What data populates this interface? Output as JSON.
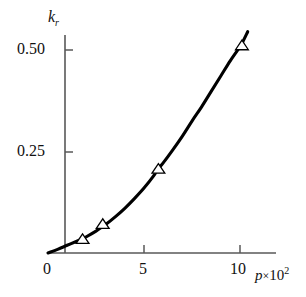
{
  "chart_data": {
    "type": "line",
    "title": "",
    "subtitle": "",
    "xlabel": "p×10²",
    "ylabel": "k_r",
    "xlabel_base": "p",
    "xlabel_exponent": "2",
    "ylabel_base": "k",
    "ylabel_subscript": "r",
    "xlim": [
      0,
      11.2
    ],
    "ylim": [
      0,
      0.57
    ],
    "xticks": [
      0,
      5,
      10
    ],
    "xtick_labels": [
      "0",
      "5",
      "10"
    ],
    "yticks": [
      0.25,
      0.5
    ],
    "ytick_labels": [
      "0.25",
      "0.50"
    ],
    "grid": false,
    "legend": null,
    "marker": "open-triangle-up",
    "line_color": "#000000",
    "marker_edge_color": "#000000",
    "marker_face_color": "#ffffff",
    "axis_color": "#4a4a4a",
    "background": "#ffffff",
    "series": [
      {
        "name": "fitted curve",
        "type": "line",
        "x": [
          0.0,
          0.5,
          1.0,
          1.5,
          1.8,
          2.0,
          2.5,
          2.75,
          3.0,
          3.5,
          4.0,
          4.5,
          5.0,
          5.5,
          5.7,
          6.0,
          6.5,
          7.0,
          7.5,
          8.0,
          8.5,
          9.0,
          9.5,
          10.0,
          10.1,
          10.4
        ],
        "y": [
          0.0,
          0.009,
          0.019,
          0.029,
          0.035,
          0.04,
          0.054,
          0.062,
          0.07,
          0.089,
          0.11,
          0.134,
          0.16,
          0.19,
          0.205,
          0.222,
          0.254,
          0.288,
          0.325,
          0.36,
          0.398,
          0.436,
          0.474,
          0.508,
          0.516,
          0.545
        ]
      },
      {
        "name": "measured data",
        "type": "scatter",
        "x": [
          1.8,
          2.85,
          5.75,
          10.1
        ],
        "y": [
          0.035,
          0.072,
          0.208,
          0.512
        ]
      }
    ]
  },
  "figure": {
    "axes": {
      "x_axis_name": "horizontal-axis",
      "y_axis_name": "vertical-axis",
      "origin_label": "0"
    }
  }
}
